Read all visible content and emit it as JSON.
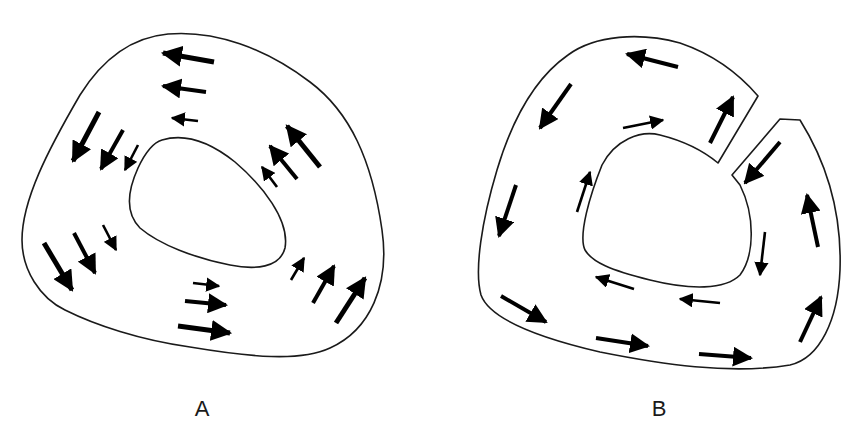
{
  "panels": [
    {
      "id": "A",
      "label": "A",
      "description": "Closed ring cross-section; arrows circulate counter-clockwise, magnitude decreasing toward inner wall",
      "arrows": [
        {
          "x1": 214,
          "y1": 62,
          "x2": 163,
          "y2": 53,
          "w": "large"
        },
        {
          "x1": 206,
          "y1": 92,
          "x2": 163,
          "y2": 86,
          "w": "medium"
        },
        {
          "x1": 198,
          "y1": 121,
          "x2": 172,
          "y2": 118,
          "w": "small"
        },
        {
          "x1": 99,
          "y1": 112,
          "x2": 73,
          "y2": 161,
          "w": "large"
        },
        {
          "x1": 123,
          "y1": 130,
          "x2": 101,
          "y2": 169,
          "w": "medium"
        },
        {
          "x1": 138,
          "y1": 145,
          "x2": 125,
          "y2": 170,
          "w": "small"
        },
        {
          "x1": 44,
          "y1": 243,
          "x2": 72,
          "y2": 290,
          "w": "large"
        },
        {
          "x1": 74,
          "y1": 233,
          "x2": 95,
          "y2": 273,
          "w": "medium"
        },
        {
          "x1": 103,
          "y1": 225,
          "x2": 116,
          "y2": 250,
          "w": "small"
        },
        {
          "x1": 193,
          "y1": 283,
          "x2": 219,
          "y2": 286,
          "w": "small"
        },
        {
          "x1": 185,
          "y1": 301,
          "x2": 226,
          "y2": 305,
          "w": "medium"
        },
        {
          "x1": 178,
          "y1": 326,
          "x2": 230,
          "y2": 333,
          "w": "large"
        },
        {
          "x1": 291,
          "y1": 280,
          "x2": 304,
          "y2": 258,
          "w": "small"
        },
        {
          "x1": 313,
          "y1": 303,
          "x2": 334,
          "y2": 266,
          "w": "medium"
        },
        {
          "x1": 336,
          "y1": 323,
          "x2": 365,
          "y2": 278,
          "w": "large"
        },
        {
          "x1": 277,
          "y1": 187,
          "x2": 262,
          "y2": 167,
          "w": "small"
        },
        {
          "x1": 297,
          "y1": 179,
          "x2": 270,
          "y2": 146,
          "w": "medium"
        },
        {
          "x1": 320,
          "y1": 167,
          "x2": 287,
          "y2": 126,
          "w": "large"
        }
      ]
    },
    {
      "id": "B",
      "label": "B",
      "description": "Ring with a radial cut at upper right; arrows circulate around the cut wall",
      "arrows": [
        {
          "x1": 678,
          "y1": 67,
          "x2": 627,
          "y2": 54,
          "w": "medium"
        },
        {
          "x1": 571,
          "y1": 84,
          "x2": 540,
          "y2": 128,
          "w": "medium"
        },
        {
          "x1": 623,
          "y1": 128,
          "x2": 663,
          "y2": 120,
          "w": "small"
        },
        {
          "x1": 710,
          "y1": 143,
          "x2": 733,
          "y2": 97,
          "w": "medium"
        },
        {
          "x1": 780,
          "y1": 142,
          "x2": 745,
          "y2": 183,
          "w": "medium"
        },
        {
          "x1": 577,
          "y1": 212,
          "x2": 590,
          "y2": 172,
          "w": "small"
        },
        {
          "x1": 516,
          "y1": 185,
          "x2": 499,
          "y2": 236,
          "w": "medium"
        },
        {
          "x1": 818,
          "y1": 247,
          "x2": 807,
          "y2": 195,
          "w": "medium"
        },
        {
          "x1": 765,
          "y1": 232,
          "x2": 760,
          "y2": 275,
          "w": "small"
        },
        {
          "x1": 634,
          "y1": 289,
          "x2": 596,
          "y2": 277,
          "w": "small"
        },
        {
          "x1": 720,
          "y1": 303,
          "x2": 680,
          "y2": 299,
          "w": "small"
        },
        {
          "x1": 501,
          "y1": 296,
          "x2": 546,
          "y2": 322,
          "w": "medium"
        },
        {
          "x1": 596,
          "y1": 338,
          "x2": 648,
          "y2": 346,
          "w": "medium"
        },
        {
          "x1": 699,
          "y1": 354,
          "x2": 751,
          "y2": 358,
          "w": "medium"
        },
        {
          "x1": 800,
          "y1": 342,
          "x2": 821,
          "y2": 297,
          "w": "medium"
        }
      ]
    }
  ],
  "style": {
    "stroke_color": "#1a1a1a",
    "arrow_color": "#000000",
    "background": "#ffffff"
  }
}
